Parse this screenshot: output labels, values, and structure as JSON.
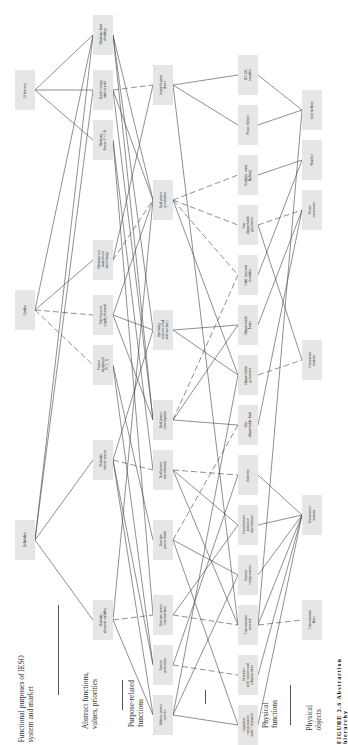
{
  "levels": [
    {
      "label": "Functional purposes of IESO\nsystem and market"
    },
    {
      "label": "Abstract functions,\nvalues, priorities"
    },
    {
      "label": "Purpose-related\nfunctions"
    },
    {
      "label": "Physical\nfunctions"
    },
    {
      "label": "Physical\nobjects"
    }
  ],
  "caption": "FIGURE 3.6 Abstraction hierarchy",
  "nodes": [
    {
      "id": "efficiency",
      "label": "Efficiency",
      "x": 25,
      "y": 90
    },
    {
      "id": "quality",
      "label": "Quality",
      "x": 25,
      "y": 310
    },
    {
      "id": "reliability",
      "label": "Reliability",
      "x": 25,
      "y": 540
    },
    {
      "id": "min_load_shed",
      "label": "Minimize load\nshedding",
      "x": 103,
      "y": 35
    },
    {
      "id": "match_energy",
      "label": "Match energy\nbids to asks",
      "x": 103,
      "y": 90
    },
    {
      "id": "min_losses",
      "label": "Minimize\nlosses P = I²R",
      "x": 103,
      "y": 140
    },
    {
      "id": "min_interchange",
      "label": "Minimize net\ninadvertent\ninterchange",
      "x": 103,
      "y": 260
    },
    {
      "id": "match_supply",
      "label": "Match power\nsupply, demand",
      "x": 103,
      "y": 315
    },
    {
      "id": "protect_equip",
      "label": "Protect\nequipment\n(V, I, T)",
      "x": 103,
      "y": 365
    },
    {
      "id": "robust",
      "label": "Maintain\nrobust system",
      "x": 103,
      "y": 460
    },
    {
      "id": "dynamic",
      "label": "Maintain\ndynamic stability",
      "x": 103,
      "y": 620
    },
    {
      "id": "import_export",
      "label": "Import/export\nflows",
      "x": 163,
      "y": 85
    },
    {
      "id": "real_gen",
      "label": "Real power\ngeneration",
      "x": 163,
      "y": 200
    },
    {
      "id": "op_reserves",
      "label": "Operating\nreserves (real\nand reactive)",
      "x": 163,
      "y": 330
    },
    {
      "id": "real_consumption",
      "label": "Real power\nconsumption",
      "x": 163,
      "y": 420
    },
    {
      "id": "real_transmission",
      "label": "Real power\ntransmission",
      "x": 163,
      "y": 470
    },
    {
      "id": "reactive_loads",
      "label": "Reactive\npower loads",
      "x": 163,
      "y": 540
    },
    {
      "id": "reactive_transmission",
      "label": "Reactive power\ntransmission",
      "x": 163,
      "y": 615
    },
    {
      "id": "sys_protection",
      "label": "System\nprotection",
      "x": 163,
      "y": 665
    },
    {
      "id": "balance_reactive",
      "label": "Balance power\nsources",
      "x": 163,
      "y": 715
    },
    {
      "id": "dc_dc",
      "label": "DC-DC\ncouplers",
      "x": 248,
      "y": 75
    },
    {
      "id": "phase_shifters",
      "label": "Phase shifters",
      "x": 248,
      "y": 125
    },
    {
      "id": "sunlight",
      "label": "Sunlight, wind,\nlighting",
      "x": 248,
      "y": 175
    },
    {
      "id": "nondisp_gen",
      "label": "Non-\ndispatchable\ngenerators",
      "x": 248,
      "y": 225
    },
    {
      "id": "cold_heat",
      "label": "Cold, heat and\nhumidity",
      "x": 248,
      "y": 275
    },
    {
      "id": "disp_loads",
      "label": "Dispatchable\nloads",
      "x": 248,
      "y": 325
    },
    {
      "id": "disp_gen",
      "label": "Dispatchable\ngenerators",
      "x": 248,
      "y": 375
    },
    {
      "id": "nondisp_load",
      "label": "Non-\ndispatchable load",
      "x": 248,
      "y": 425
    },
    {
      "id": "switches",
      "label": "Switches",
      "x": 248,
      "y": 475
    },
    {
      "id": "transformers",
      "label": "Transformers\nand auto-\ntransformers",
      "x": 248,
      "y": 525
    },
    {
      "id": "reactor_comp",
      "label": "Reactor\ncompensators",
      "x": 248,
      "y": 575
    },
    {
      "id": "trans_network",
      "label": "Transmission\nnetwork",
      "x": 248,
      "y": 625
    },
    {
      "id": "breakers",
      "label": "Breakers\nincl. sensors and\nteleprotection",
      "x": 248,
      "y": 675
    },
    {
      "id": "capacitor",
      "label": "Capacitor\ncompensators\nstatic + dynamic",
      "x": 248,
      "y": 725
    },
    {
      "id": "intertie",
      "label": "Intertie lines",
      "x": 312,
      "y": 110
    },
    {
      "id": "weather",
      "label": "Weather",
      "x": 312,
      "y": 160
    },
    {
      "id": "power_consumers",
      "label": "Power\nconsumers",
      "x": 312,
      "y": 210
    },
    {
      "id": "gen_stations",
      "label": "Generation\nstations",
      "x": 312,
      "y": 360
    },
    {
      "id": "transformer_stations",
      "label": "Transformer\nstations",
      "x": 312,
      "y": 515
    },
    {
      "id": "trans_lines",
      "label": "Transmission\nlines",
      "x": 312,
      "y": 620
    }
  ],
  "edges": [
    [
      "efficiency",
      "min_load_shed"
    ],
    [
      "efficiency",
      "match_energy"
    ],
    [
      "efficiency",
      "min_losses"
    ],
    [
      "quality",
      "min_interchange"
    ],
    [
      "quality",
      "match_supply",
      "d"
    ],
    [
      "quality",
      "protect_equip",
      "d"
    ],
    [
      "quality",
      "min_load_shed"
    ],
    [
      "reliability",
      "min_load_shed"
    ],
    [
      "reliability",
      "robust"
    ],
    [
      "reliability",
      "dynamic"
    ],
    [
      "reliability",
      "match_energy"
    ],
    [
      "min_load_shed",
      "real_gen"
    ],
    [
      "min_load_shed",
      "op_reserves"
    ],
    [
      "min_load_shed",
      "real_consumption"
    ],
    [
      "match_energy",
      "import_export",
      "d"
    ],
    [
      "match_energy",
      "real_gen"
    ],
    [
      "match_energy",
      "real_consumption"
    ],
    [
      "min_losses",
      "real_transmission"
    ],
    [
      "min_losses",
      "reactive_transmission"
    ],
    [
      "min_interchange",
      "import_export"
    ],
    [
      "min_interchange",
      "real_gen",
      "d"
    ],
    [
      "match_supply",
      "real_gen"
    ],
    [
      "match_supply",
      "real_consumption"
    ],
    [
      "match_supply",
      "op_reserves"
    ],
    [
      "protect_equip",
      "sys_protection"
    ],
    [
      "protect_equip",
      "reactive_loads"
    ],
    [
      "robust",
      "real_transmission",
      "d"
    ],
    [
      "robust",
      "op_reserves"
    ],
    [
      "robust",
      "sys_protection"
    ],
    [
      "robust",
      "balance_reactive"
    ],
    [
      "dynamic",
      "reactive_transmission",
      "d"
    ],
    [
      "dynamic",
      "balance_reactive"
    ],
    [
      "dynamic",
      "real_gen"
    ],
    [
      "import_export",
      "dc_dc"
    ],
    [
      "import_export",
      "phase_shifters"
    ],
    [
      "import_export",
      "trans_network"
    ],
    [
      "real_gen",
      "sunlight",
      "d"
    ],
    [
      "real_gen",
      "nondisp_gen",
      "d"
    ],
    [
      "real_gen",
      "disp_gen"
    ],
    [
      "real_gen",
      "cold_heat",
      "d"
    ],
    [
      "op_reserves",
      "disp_gen"
    ],
    [
      "op_reserves",
      "disp_loads"
    ],
    [
      "real_consumption",
      "disp_loads"
    ],
    [
      "real_consumption",
      "nondisp_load"
    ],
    [
      "real_consumption",
      "cold_heat",
      "d"
    ],
    [
      "real_transmission",
      "trans_network"
    ],
    [
      "real_transmission",
      "switches",
      "d"
    ],
    [
      "real_transmission",
      "transformers"
    ],
    [
      "reactive_loads",
      "reactor_comp"
    ],
    [
      "reactive_loads",
      "capacitor"
    ],
    [
      "reactive_loads",
      "nondisp_load",
      "d"
    ],
    [
      "reactive_transmission",
      "trans_network",
      "d"
    ],
    [
      "reactive_transmission",
      "transformers"
    ],
    [
      "sys_protection",
      "breakers",
      "d"
    ],
    [
      "sys_protection",
      "switches"
    ],
    [
      "balance_reactive",
      "capacitor"
    ],
    [
      "balance_reactive",
      "reactor_comp"
    ],
    [
      "balance_reactive",
      "disp_gen"
    ],
    [
      "dc_dc",
      "intertie"
    ],
    [
      "phase_shifters",
      "intertie"
    ],
    [
      "sunlight",
      "weather"
    ],
    [
      "nondisp_gen",
      "power_consumers",
      "d"
    ],
    [
      "nondisp_gen",
      "gen_stations"
    ],
    [
      "cold_heat",
      "weather"
    ],
    [
      "disp_loads",
      "power_consumers"
    ],
    [
      "disp_gen",
      "gen_stations",
      "d"
    ],
    [
      "nondisp_load",
      "power_consumers"
    ],
    [
      "switches",
      "transformer_stations"
    ],
    [
      "transformers",
      "transformer_stations"
    ],
    [
      "reactor_comp",
      "transformer_stations"
    ],
    [
      "trans_network",
      "trans_lines",
      "d"
    ],
    [
      "trans_network",
      "intertie"
    ],
    [
      "trans_network",
      "transformer_stations"
    ],
    [
      "breakers",
      "transformer_stations"
    ],
    [
      "capacitor",
      "transformer_stations"
    ]
  ]
}
